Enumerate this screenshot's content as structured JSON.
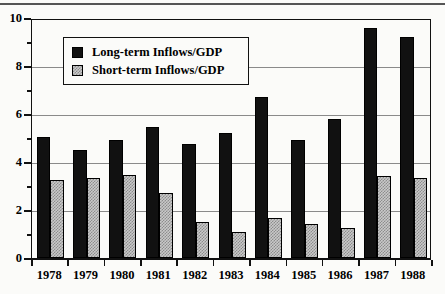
{
  "chart_data": {
    "type": "bar",
    "title": "",
    "subtitle": "",
    "xlabel": "",
    "ylabel": "",
    "categories": [
      "1978",
      "1979",
      "1980",
      "1981",
      "1982",
      "1983",
      "1984",
      "1985",
      "1986",
      "1987",
      "1988"
    ],
    "series": [
      {
        "name": "Long-term Inflows/GDP",
        "values": [
          5.05,
          4.5,
          4.9,
          5.45,
          4.75,
          5.2,
          6.7,
          4.9,
          5.8,
          9.6,
          9.2
        ],
        "color": "#111111",
        "fill": "solid-black"
      },
      {
        "name": "Short-term Inflows/GDP",
        "values": [
          3.25,
          3.35,
          3.45,
          2.7,
          1.5,
          1.1,
          1.65,
          1.4,
          1.25,
          3.4,
          3.35
        ],
        "color": "#c9c9c9",
        "fill": "gray-checkered"
      }
    ],
    "ylim": [
      0,
      10
    ],
    "y_major_ticks": [
      0,
      2,
      4,
      6,
      8,
      10
    ],
    "y_minor_ticks": [
      1,
      3,
      5,
      7,
      9
    ],
    "y_tick_labels": [
      "0",
      "2",
      "4",
      "6",
      "8",
      "10"
    ],
    "gridlines": {
      "horizontal": [
        2,
        4,
        6,
        8
      ],
      "vertical": false
    },
    "legend": {
      "position": "top-left-inside",
      "entries": [
        "Long-term Inflows/GDP",
        "Short-term Inflows/GDP"
      ]
    }
  }
}
